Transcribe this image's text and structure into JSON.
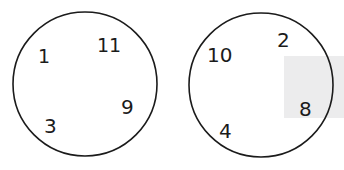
{
  "worksheet": {
    "title": "Number sorting circles",
    "background_color": "#ffffff",
    "ink_color": "#1b1b1b",
    "shading_color": "#ececed"
  },
  "shading_overlay": {
    "name": "gray-smudge-overlay",
    "left": 284,
    "top": 56,
    "width": 60,
    "height": 62
  },
  "groups": [
    {
      "id": "left-circle",
      "label": "left-circle",
      "center_x": 85,
      "center_y": 84,
      "radius": 72,
      "numbers": [
        {
          "value": "1",
          "x": 38,
          "y": 47,
          "size": 19
        },
        {
          "value": "11",
          "x": 97,
          "y": 36,
          "size": 19
        },
        {
          "value": "9",
          "x": 121,
          "y": 97,
          "size": 20
        },
        {
          "value": "3",
          "x": 44,
          "y": 116,
          "size": 20
        }
      ]
    },
    {
      "id": "right-circle",
      "label": "right-circle",
      "center_x": 261,
      "center_y": 85,
      "radius": 72,
      "numbers": [
        {
          "value": "10",
          "x": 207,
          "y": 45,
          "size": 20
        },
        {
          "value": "2",
          "x": 277,
          "y": 30,
          "size": 20
        },
        {
          "value": "8",
          "x": 299,
          "y": 99,
          "size": 20
        },
        {
          "value": "4",
          "x": 219,
          "y": 121,
          "size": 20
        }
      ]
    }
  ]
}
